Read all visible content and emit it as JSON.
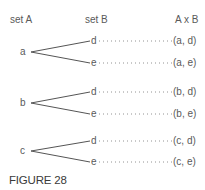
{
  "headers": {
    "set_a": "set A",
    "set_b": "set B",
    "product": "A x B"
  },
  "groups": [
    {
      "root": "a",
      "branches": [
        {
          "leaf": "d",
          "pair": "(a, d)"
        },
        {
          "leaf": "e",
          "pair": "(a, e)"
        }
      ]
    },
    {
      "root": "b",
      "branches": [
        {
          "leaf": "d",
          "pair": "(b, d)"
        },
        {
          "leaf": "e",
          "pair": "(b, e)"
        }
      ]
    },
    {
      "root": "c",
      "branches": [
        {
          "leaf": "d",
          "pair": "(c, d)"
        },
        {
          "leaf": "e",
          "pair": "(c, e)"
        }
      ]
    }
  ],
  "caption": "FIGURE 28",
  "colors": {
    "line": "#555555",
    "text": "#5a5a5a",
    "dots": "#777777"
  }
}
